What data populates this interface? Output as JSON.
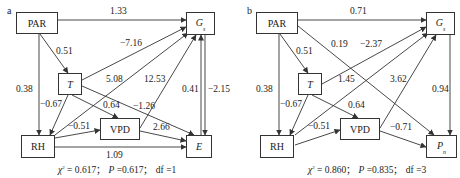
{
  "panels": [
    {
      "label": "a",
      "nodes": {
        "par": "PAR",
        "t": "T",
        "rh": "RH",
        "vpd": "VPD",
        "gs_main": "G",
        "gs_sub": "s",
        "e": "E"
      },
      "edges": {
        "par_gs": "1.33",
        "par_t": "0.51",
        "par_rh": "0.38",
        "t_gs": "−7.16",
        "t_rh": "−0.67",
        "t_vpd": "0.64",
        "t_e": "−1.26",
        "rh_gs": "5.08",
        "rh_vpd": "−0.51",
        "rh_e": "1.09",
        "vpd_gs": "12.53",
        "vpd_e": "2.66",
        "e_gs": "0.41",
        "gs_e": "−2.15"
      },
      "fit": {
        "chi_symbol": "χ",
        "chi_sup": "2",
        "chi_value": " = 0.617；",
        "p_symbol": "P",
        "p_value": " =0.617；",
        "df": "df =1"
      }
    },
    {
      "label": "b",
      "nodes": {
        "par": "PAR",
        "t": "T",
        "rh": "RH",
        "vpd": "VPD",
        "gs_main": "G",
        "gs_sub": "s",
        "pn_main": "P",
        "pn_sub": "n"
      },
      "edges": {
        "par_gs": "0.71",
        "par_t": "0.51",
        "par_rh": "0.38",
        "par_pn": "0.19",
        "t_gs": "−2.37",
        "t_rh": "−0.67",
        "t_vpd": "0.64",
        "rh_gs": "1.45",
        "rh_vpd": "−0.51",
        "vpd_gs": "3.62",
        "vpd_pn": "−0.71",
        "gs_pn": "0.94"
      },
      "fit": {
        "chi_symbol": "χ",
        "chi_sup": "2",
        "chi_value": " = 0.860；",
        "p_symbol": "P",
        "p_value": " =0.835；",
        "df": "df =3"
      }
    }
  ],
  "colors": {
    "line": "#333333",
    "text": "#222222"
  }
}
